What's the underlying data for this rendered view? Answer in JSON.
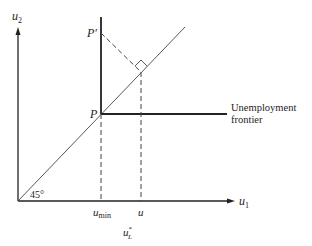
{
  "diagram": {
    "type": "economic-utility-diagram",
    "axes": {
      "x_label": "u",
      "x_subscript": "1",
      "y_label": "u",
      "y_subscript": "2"
    },
    "points": {
      "P": "P",
      "P_prime": "P′"
    },
    "angle_label": "45°",
    "frontier_label_line1": "Unemployment",
    "frontier_label_line2": "frontier",
    "x_ticks": {
      "u_min": "u",
      "u_min_sub": "min",
      "u": "u"
    },
    "bottom_label": "u",
    "bottom_label_sub": "L",
    "bottom_label_sup": "*",
    "colors": {
      "line": "#222222",
      "thin_line": "#444444",
      "background": "#ffffff"
    }
  }
}
